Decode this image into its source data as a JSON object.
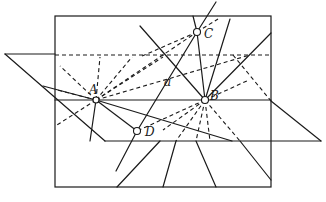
{
  "diagram": {
    "type": "geometry-figure",
    "labels": {
      "A": "A",
      "B": "B",
      "C": "C",
      "D": "D",
      "a": "a"
    },
    "points": {
      "A": [
        96,
        100
      ],
      "B": [
        205,
        100
      ],
      "C": [
        197,
        32
      ],
      "D": [
        137,
        131
      ]
    },
    "colors": {
      "stroke": "#1a1a1a",
      "background": "#ffffff"
    }
  }
}
